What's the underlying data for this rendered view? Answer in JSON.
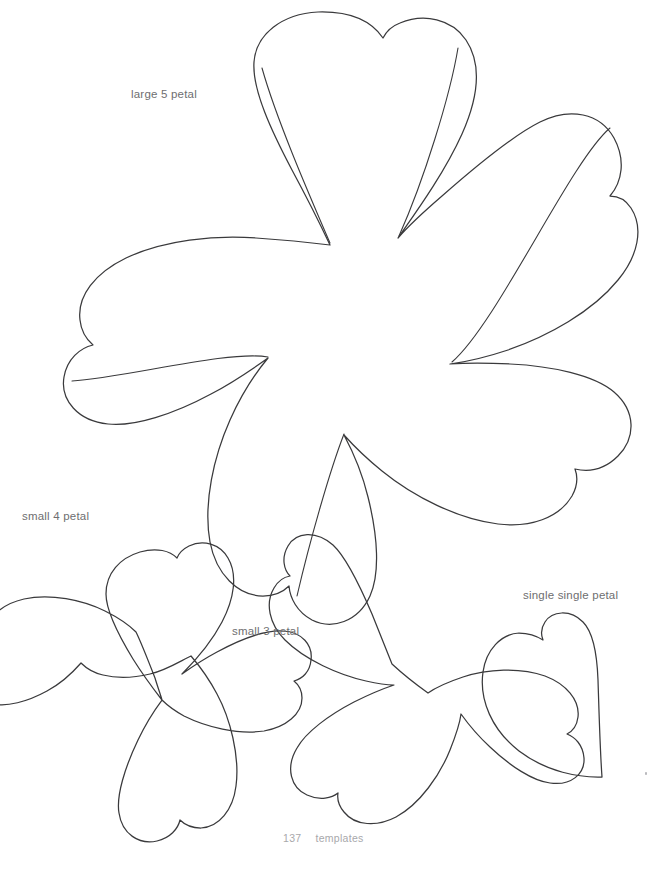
{
  "page": {
    "width": 663,
    "height": 886,
    "background": "#ffffff",
    "stroke_color": "#3a3a3c",
    "label_color": "#6e6e70",
    "footer_color": "#a8a8ab"
  },
  "labels": [
    {
      "id": "large5",
      "text": "large 5 petal",
      "x": 131,
      "y": 89,
      "target": "large-5-petal-template"
    },
    {
      "id": "small4",
      "text": "small 4 petal",
      "x": 22,
      "y": 511,
      "target": "small-4-petal-template"
    },
    {
      "id": "small3",
      "text": "small 3 petal",
      "x": 232,
      "y": 626,
      "target": "small-3-petal-template"
    },
    {
      "id": "single",
      "text": "single single petal",
      "x": 523,
      "y": 590,
      "target": "single-petal-template"
    }
  ],
  "footer": {
    "page_number": "137",
    "section": "templates"
  },
  "templates": [
    {
      "id": "large-5-petal-template",
      "name": "large 5 petal",
      "petal_count": 5,
      "bbox": {
        "x": 62,
        "y": 12,
        "width": 570,
        "height": 560
      }
    },
    {
      "id": "small-4-petal-template",
      "name": "small 4 petal",
      "petal_count": 4,
      "clipped_at_page_edge": "left",
      "bbox": {
        "x": 0,
        "y": 528,
        "width": 296,
        "height": 358
      }
    },
    {
      "id": "small-3-petal-template",
      "name": "small 3 petal",
      "petal_count": 3,
      "bbox": {
        "x": 284,
        "y": 530,
        "width": 190,
        "height": 296
      }
    },
    {
      "id": "single-petal-template",
      "name": "single single petal",
      "petal_count": 1,
      "bbox": {
        "x": 482,
        "y": 612,
        "width": 130,
        "height": 166
      }
    }
  ],
  "artifacts": [
    {
      "id": "speck-1",
      "x": 645,
      "y": 772
    }
  ]
}
